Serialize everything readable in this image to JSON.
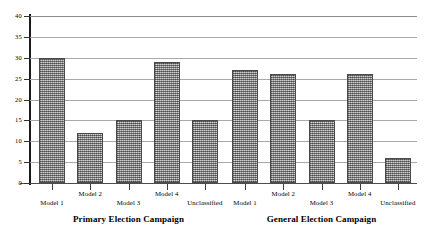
{
  "chart_data": {
    "type": "bar",
    "title": "",
    "xlabel": "",
    "ylabel": "",
    "ylim": [
      0,
      40
    ],
    "ytick_values": [
      0,
      5,
      10,
      15,
      20,
      25,
      30,
      35,
      40
    ],
    "ytick_labels": [
      "0",
      "5",
      "10",
      "15",
      "20",
      "25",
      "30",
      "35",
      "40"
    ],
    "grid": true,
    "legend": "none",
    "categories": [
      "Model 1",
      "Model 2",
      "Model 3",
      "Model 4",
      "Unclassified"
    ],
    "panels": [
      {
        "caption": "Primary Election Campaign",
        "categories": [
          "Model 1",
          "Model 2",
          "Model 3",
          "Model 4",
          "Unclassified"
        ],
        "values": [
          30,
          12,
          15,
          29,
          15
        ]
      },
      {
        "caption": "General Election Campaign",
        "categories": [
          "Model 1",
          "Model 2",
          "Model 3",
          "Model 4",
          "Unclassified"
        ],
        "values": [
          27,
          26,
          15,
          26,
          6
        ]
      }
    ],
    "colors": {
      "bar_fill": "#8e8e8e",
      "bar_border": "#4a4a4a",
      "gridline": "#a9a9a9",
      "axis": "#1a1a1a",
      "text": "#000000"
    }
  }
}
